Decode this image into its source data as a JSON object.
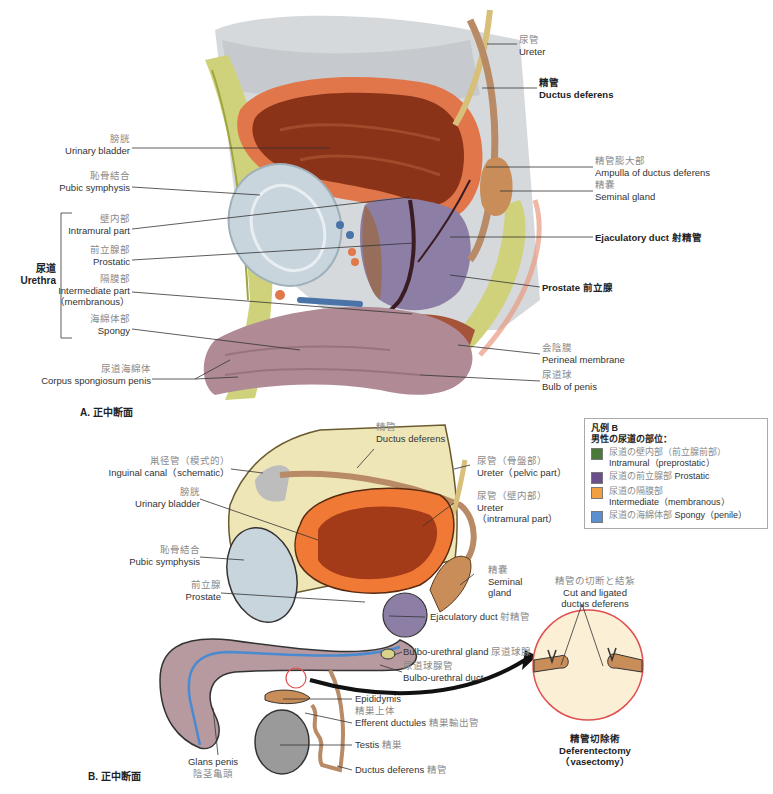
{
  "figure_a": {
    "caption": "A.  正中断面",
    "labels": {
      "ureter": {
        "ja": "尿管",
        "en": "Ureter"
      },
      "ductus_deferens": {
        "ja": "精管",
        "en": "Ductus deferens"
      },
      "ampulla": {
        "ja": "精管膨大部",
        "en": "Ampulla of ductus deferens"
      },
      "seminal_gland": {
        "ja": "精嚢",
        "en": "Seminal gland"
      },
      "ejaculatory_duct": {
        "en": "Ejaculatory duct",
        "ja": "射精管"
      },
      "prostate": {
        "en": "Prostate",
        "ja": "前立腺"
      },
      "perineal_membrane": {
        "ja": "会陰膜",
        "en": "Perineal membrane"
      },
      "bulb_of_penis": {
        "ja": "尿道球",
        "en": "Bulb of penis"
      },
      "urinary_bladder": {
        "ja": "膀胱",
        "en": "Urinary bladder"
      },
      "pubic_symphysis": {
        "ja": "恥骨結合",
        "en": "Pubic symphysis"
      },
      "urethra_group": {
        "ja": "尿道",
        "en": "Urethra"
      },
      "intramural_part": {
        "ja": "壁内部",
        "en": "Intramural part"
      },
      "prostatic": {
        "ja": "前立腺部",
        "en": "Prostatic"
      },
      "intermediate_part": {
        "ja": "隔膜部",
        "en": "Intermediate part",
        "en2": "（membranous）"
      },
      "spongy": {
        "ja": "海綿体部",
        "en": "Spongy"
      },
      "corpus_spongiosum": {
        "ja": "尿道海綿体",
        "en": "Corpus spongiosum penis"
      }
    }
  },
  "figure_b": {
    "caption": "B.  正中断面",
    "labels": {
      "ductus_deferens_top": {
        "ja": "精管",
        "en": "Ductus deferens"
      },
      "inguinal_canal": {
        "ja": "鼡径管（模式的）",
        "en": "Inguinal canal（schematic）"
      },
      "ureter_pelvic": {
        "ja": "尿管（骨盤部）",
        "en": "Ureter（pelvic part）"
      },
      "ureter_intramural": {
        "ja": "尿管（壁内部）",
        "en": "Ureter",
        "en2": "（intramural part）"
      },
      "urinary_bladder": {
        "ja": "膀胱",
        "en": "Urinary bladder"
      },
      "pubic_symphysis": {
        "ja": "恥骨結合",
        "en": "Pubic symphysis"
      },
      "prostate": {
        "ja": "前立腺",
        "en": "Prostate"
      },
      "seminal_gland": {
        "ja": "精嚢",
        "en": "Seminal",
        "en2": "gland"
      },
      "ejaculatory_duct": {
        "en": "Ejaculatory duct",
        "ja": "射精管"
      },
      "bulbourethral_gland": {
        "en": "Bulbo-urethral gland",
        "ja": "尿道球腺"
      },
      "bulbourethral_duct": {
        "ja": "尿道球腺管",
        "en": "Bulbo-urethral duct"
      },
      "epididymis": {
        "en": "Epididymis",
        "ja": "精巣上体"
      },
      "efferent_ductules": {
        "en": "Efferent ductules",
        "ja": "精巣輸出管"
      },
      "testis": {
        "en": "Testis",
        "ja": "精巣"
      },
      "ductus_deferens_bottom": {
        "en": "Ductus deferens",
        "ja": "精管"
      },
      "glans_penis": {
        "en": "Glans penis",
        "ja": "陰茎亀頭"
      },
      "cut_ligated": {
        "ja": "精管の切断と結紮",
        "en": "Cut and ligated",
        "en2": "ductus deferens"
      },
      "vasectomy": {
        "ja": "精管切除術",
        "en": "Deferentectomy",
        "en2": "（vasectomy）"
      }
    }
  },
  "legend": {
    "title_line1": "凡例 B",
    "title_line2": "男性の尿道の部位：",
    "items": [
      {
        "ja": "尿道の壁内部（前立腺前部）",
        "en": "Intramural（preprostatic）",
        "color": "#4a7a3a"
      },
      {
        "ja": "尿道の前立腺部",
        "en": "Prostatic",
        "color": "#6b4f8c"
      },
      {
        "ja": "尿道の隔膜部",
        "en": "Intermediate（membranous）",
        "color": "#f0a040"
      },
      {
        "ja": "尿道の海綿体部",
        "en": "Spongy（penile）",
        "color": "#5b8fd0"
      }
    ]
  },
  "colors": {
    "bladder_wall": "#e0764a",
    "bladder_lumen": "#8a3318",
    "prostate": "#8d7ea6",
    "fat": "#cfd27a",
    "pubic": "#c9d5dc",
    "spongiosum": "#b08a95",
    "seminal": "#c98d5a",
    "callout_ring": "#e05050"
  }
}
